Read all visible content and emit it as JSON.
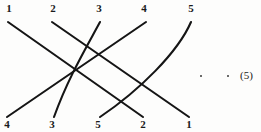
{
  "figure": {
    "kind": "permutation-wiring-diagram",
    "top_labels": [
      "1",
      "2",
      "3",
      "4",
      "5"
    ],
    "bottom_labels": [
      "4",
      "3",
      "5",
      "2",
      "1"
    ],
    "top_label_x": [
      2,
      46,
      92,
      137,
      184
    ],
    "bottom_label_x": [
      0,
      45,
      91,
      136,
      182
    ],
    "equation_number": "(5)",
    "ellipsis_dots": 2,
    "ink_color": "#151515",
    "label_color": "#1a1a1a",
    "strands": [
      {
        "name": "strand-1",
        "from": "1",
        "to": "2",
        "d": "M 8 22 L 143 117"
      },
      {
        "name": "strand-2",
        "from": "2",
        "to": "1",
        "d": "M 52 22 L 189 117"
      },
      {
        "name": "strand-3",
        "from": "3",
        "to": "3",
        "d": "M 100 22 C 86 48 68 78 54 117"
      },
      {
        "name": "strand-4",
        "from": "4",
        "to": "4",
        "d": "M 146 22 L 7 117"
      },
      {
        "name": "strand-5",
        "from": "5",
        "to": "5",
        "d": "M 191 22 C 178 52 140 90 100 117"
      }
    ]
  },
  "annotations": {
    "dots": [
      {
        "name": "ellipsis-dot-1",
        "x": 200,
        "y": 75
      },
      {
        "name": "ellipsis-dot-2",
        "x": 227,
        "y": 75
      }
    ],
    "equation_label": {
      "name": "equation-number",
      "x": 240,
      "y": 69
    }
  }
}
